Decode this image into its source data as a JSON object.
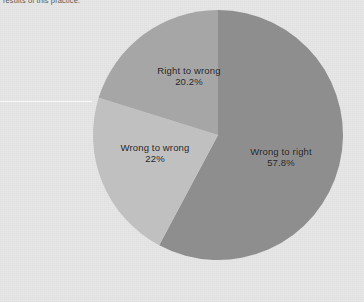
{
  "caption": {
    "text_fragment": "results of this practice."
  },
  "chart_data": {
    "type": "pie",
    "title": "",
    "subtitle": "",
    "xlabel": "",
    "ylabel": "",
    "legend_position": "none",
    "grid": false,
    "units": "percent",
    "categories": [
      "Wrong to right",
      "Wrong to wrong",
      "Right to wrong"
    ],
    "values": [
      57.8,
      22,
      20.2
    ],
    "slices": [
      {
        "label": "Wrong to right",
        "value": 57.8,
        "value_label": "57.8%",
        "color": "#8e8e8e",
        "start_angle_deg": 0,
        "end_angle_deg": 208.08
      },
      {
        "label": "Wrong to wrong",
        "value": 22,
        "value_label": "22%",
        "color": "#c0c0c0",
        "start_angle_deg": 208.08,
        "end_angle_deg": 287.28
      },
      {
        "label": "Right to wrong",
        "value": 20.2,
        "value_label": "20.2%",
        "color": "#a6a6a6",
        "start_angle_deg": 287.28,
        "end_angle_deg": 360
      }
    ]
  },
  "colors": {
    "background": "#e7e7e7",
    "label_text": "#1d1d1d",
    "caption_text": "#3a3a3a",
    "slice_wrong_to_right": "#8e8e8e",
    "slice_wrong_to_wrong": "#c0c0c0",
    "slice_right_to_wrong": "#a6a6a6"
  },
  "geometry": {
    "center_x": 218,
    "center_y": 135,
    "radius": 125
  }
}
